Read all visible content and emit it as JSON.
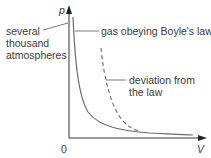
{
  "diagram": {
    "axes": {
      "y_label": "p",
      "x_label": "V",
      "origin_label": "0"
    },
    "annotations": {
      "pressure_note": [
        "several",
        "thousand",
        "atmospheres"
      ],
      "ideal_curve": "gas obeying Boyle's law",
      "deviation_curve": [
        "deviation from",
        "the law"
      ]
    },
    "colors": {
      "axis": "#333333",
      "curve": "#6a6a6a",
      "leader": "#555555"
    }
  }
}
